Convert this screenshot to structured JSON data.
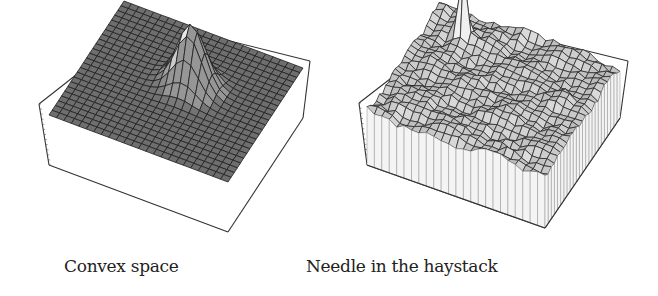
{
  "figure": {
    "panels": [
      {
        "id": "left",
        "caption": "Convex space",
        "surface": {
          "type": "single-peak",
          "grid": 24,
          "floor_color": "#6e6e6e",
          "peak_color": "#e8e8e8",
          "line_color": "#1e1e1e",
          "peak": {
            "u": 0.42,
            "v": 0.55,
            "height": 1.0,
            "width": 0.075
          },
          "noise": 0.0
        },
        "box": {
          "left_bottom": [
            49,
            165
          ],
          "front_bottom": [
            228,
            232
          ],
          "right_bottom": [
            303,
            118
          ],
          "left_top": [
            39,
            104
          ],
          "back_top": [
            146,
            20
          ],
          "right_top": [
            310,
            61
          ],
          "box_height": 61
        }
      },
      {
        "id": "right",
        "caption": "Needle in the haystack",
        "surface": {
          "type": "noisy-with-needle",
          "grid": 24,
          "floor_color": "#d4d4d4",
          "peak_color": "#efefef",
          "line_color": "#2a2a2a",
          "peak": {
            "u": 0.2,
            "v": 0.2,
            "height": 1.25,
            "width": 0.02
          },
          "noise": 0.16
        },
        "box": {
          "left_bottom": [
            38,
            165
          ],
          "front_bottom": [
            216,
            228
          ],
          "right_bottom": [
            291,
            118
          ],
          "left_top": [
            30,
            103
          ],
          "back_top": [
            136,
            21
          ],
          "right_top": [
            299,
            61
          ],
          "box_height": 62
        }
      }
    ]
  }
}
